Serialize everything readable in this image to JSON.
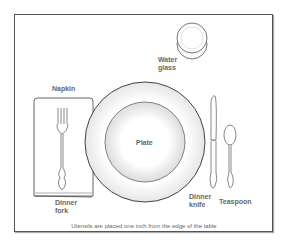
{
  "diagram": {
    "labels": {
      "water_glass": "Water glass",
      "napkin": "Napkin",
      "plate": "Plate",
      "dinner_fork": "Dinner fork",
      "dinner_knife": "Dinner knife",
      "teaspoon": "Teaspoon"
    },
    "label_lines": {
      "water_glass": [
        "Water",
        "glass"
      ],
      "dinner_fork": [
        "Dinner",
        "fork"
      ],
      "dinner_knife": [
        "Dinner",
        "knife"
      ]
    },
    "caption": "Utensils are placed one inch from the edge of the table",
    "colors": {
      "stroke": "#555555",
      "label": "#666666",
      "frame": "#555555"
    }
  }
}
